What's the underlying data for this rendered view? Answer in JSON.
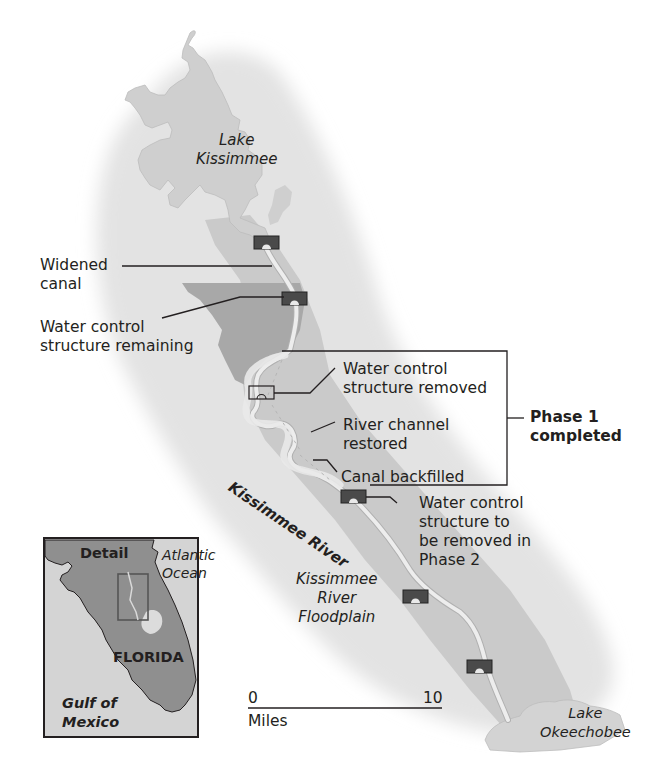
{
  "map": {
    "colors": {
      "background": "#ffffff",
      "regional_halo": "#e2e2e2",
      "floodplain": "#c9c9c9",
      "remaining_structure_area": "#a9a9a9",
      "lake": "#cfcfcf",
      "canal": "#ececec",
      "structure_fill": "#4a4a4a",
      "line": "#231f20",
      "inset_land": "#8e8e8e",
      "inset_water": "#d6d6d6"
    },
    "labels": {
      "lake_kissimmee": "Lake\nKissimmee",
      "widened_canal": "Widened\ncanal",
      "water_control_remaining": "Water control\nstructure remaining",
      "water_control_removed": "Water control\nstructure removed",
      "river_channel_restored": "River channel\nrestored",
      "canal_backfilled": "Canal backfilled",
      "phase1": "Phase 1\ncompleted",
      "water_control_phase2": "Water control\nstructure to\nbe removed in\nPhase 2",
      "kissimmee_river": "Kissimmee River",
      "floodplain": "Kissimmee\nRiver\nFloodplain",
      "lake_okeechobee": "Lake\nOkeechobee"
    },
    "scale": {
      "start": "0",
      "end": "10",
      "unit": "Miles"
    },
    "inset": {
      "detail": "Detail",
      "atlantic": "Atlantic\nOcean",
      "state": "FLORIDA",
      "gulf": "Gulf of\nMexico"
    }
  }
}
